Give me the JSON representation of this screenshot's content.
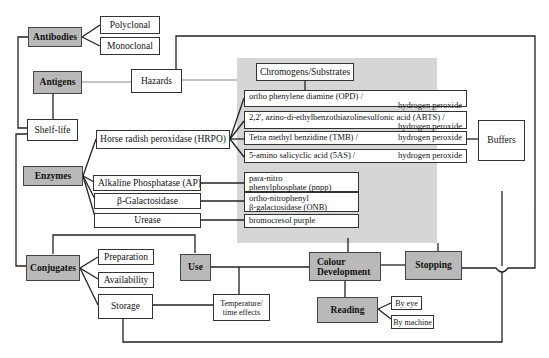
{
  "diagram": {
    "categories": {
      "antibodies": "Antibodies",
      "antigens": "Antigens",
      "enzymes": "Enzymes",
      "conjugates": "Conjugates",
      "use": "Use",
      "colour_development": "Colour Development",
      "stopping": "Stopping",
      "reading": "Reading"
    },
    "antibody_types": [
      "Polyclonal",
      "Monoclonal"
    ],
    "hazards": "Hazards",
    "shelf_life": "Shelf-life",
    "buffers": "Buffers",
    "chromogens_header": "Chromogens/Substrates",
    "enzymes_list": [
      "Horse radish peroxidase (HRPO)",
      "Alkaline Phosphatase (AP)",
      "β-Galactosidase",
      "Urease"
    ],
    "substrates": [
      {
        "line1": "ortho phenylene diamine (OPD) /",
        "line2": "hydrogen peroxide"
      },
      {
        "line1": "2,2', azino-di-ethylbenzothiazolinesulfonic acid  (ABTS) /",
        "line2": "hydrogen peroxide"
      },
      {
        "line1": "Tetra methyl benzidine (TMB) /",
        "line2": "hydrogen peroxide"
      },
      {
        "line1": "5-amino salicyclic acid (5AS) /",
        "line2": "hydrogen peroxide"
      },
      {
        "line1": "para-nitro",
        "line2": "phenylphosphate (pnpp)"
      },
      {
        "line1": "ortho-nitrophenyl",
        "line2": "β-galactosidase (ONB)"
      },
      {
        "line1": "bromocresol purple",
        "line2": ""
      }
    ],
    "conjugate_items": [
      "Preparation",
      "Availability",
      "Storage"
    ],
    "temperature": {
      "line1": "Temperature/",
      "line2": "time effects"
    },
    "reading_methods": [
      "By eye",
      "By machine"
    ],
    "colors": {
      "grey_box": "#b9b9b9",
      "panel": "#d6d6d6",
      "line": "#222222"
    }
  }
}
